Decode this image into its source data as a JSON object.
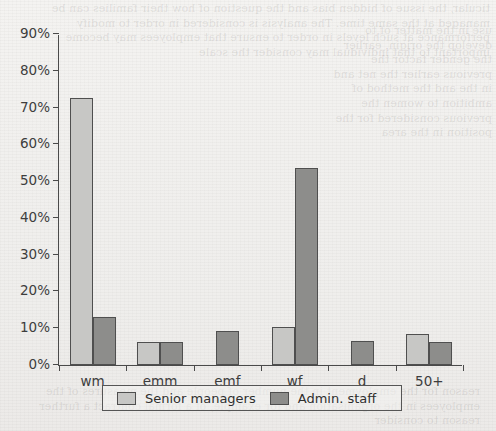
{
  "chart_data": {
    "type": "bar",
    "title": "",
    "xlabel": "",
    "ylabel": "",
    "categories": [
      "wm",
      "emm",
      "emf",
      "wf",
      "d",
      "50+"
    ],
    "series": [
      {
        "name": "Senior managers",
        "color": "#c7c7c5",
        "values": [
          72.5,
          6.2,
          0,
          10.3,
          0,
          8.5
        ]
      },
      {
        "name": "Admin. staff",
        "color": "#8d8d8b",
        "values": [
          13.0,
          6.2,
          9.3,
          53.5,
          6.4,
          6.3
        ]
      }
    ],
    "ylim": [
      0,
      90
    ],
    "ytick_values": [
      0,
      10,
      20,
      30,
      40,
      50,
      60,
      70,
      80,
      90
    ],
    "ytick_labels": [
      "0%",
      "10%",
      "20%",
      "30%",
      "40%",
      "50%",
      "60%",
      "70%",
      "80%",
      "90%"
    ],
    "grid": false,
    "legend_position": "bottom"
  },
  "legend": {
    "entries": [
      {
        "label": "Senior managers",
        "swatch": "light"
      },
      {
        "label": "Admin. staff",
        "swatch": "dark"
      }
    ]
  },
  "background": {
    "ghost_top": "ticular, the issue of hidden bias and the question of how their families can be managed at the same time. The analysis is considered in order to modify performance at such levels in order to ensure that employees may become important to that individual may consider the scale",
    "ghost_right": "use in the matter of to develop the origin, earlier the gender factor the previous earlier the net and in the and the method of ambition to women the previous considered for the position in the area",
    "ghost_bottom": "reason for the employment in the number of people and the measures of the employees in the organisation and for example, of a formal contract a further reason to consider"
  }
}
